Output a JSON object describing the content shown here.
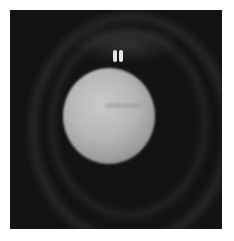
{
  "image": {
    "kind": "grayscale scientific image",
    "subject": "bright sphere on dark background with concentric faint rings and a small bright double spot above",
    "colors": {
      "background": "#131313",
      "sphere_highlight": "#c9c9c9",
      "sphere_edge": "#6a6a6a",
      "spot": "#e6e6e6",
      "page": "#ffffff"
    }
  }
}
